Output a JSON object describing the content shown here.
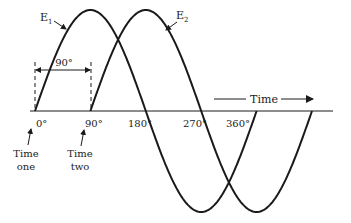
{
  "diagram": {
    "axis": {
      "y": 111,
      "x_start": 30,
      "x_end": 333,
      "origin_x": 35,
      "step_px": 55.4,
      "amplitude_px": 101
    },
    "waves": [
      {
        "name": "E1",
        "label_main": "E",
        "label_sub": "1",
        "start_deg": 0,
        "end_deg": 360,
        "stroke": "#1a1a1a"
      },
      {
        "name": "E2",
        "label_main": "E",
        "label_sub": "2",
        "start_deg": 90,
        "end_deg": 450,
        "stroke": "#1a1a1a"
      }
    ],
    "tick_labels": [
      {
        "text": "0°",
        "deg": 0
      },
      {
        "text": "90°",
        "deg": 90
      },
      {
        "text": "180°",
        "deg": 180
      },
      {
        "text": "270°",
        "deg": 270
      },
      {
        "text": "360°",
        "deg": 360
      }
    ],
    "phase_dimension": {
      "text": "90°",
      "from_deg": 0,
      "to_deg": 90
    },
    "time_arrow_label": "Time",
    "time_markers": [
      {
        "line1": "Time",
        "line2": "one",
        "deg": 0
      },
      {
        "line1": "Time",
        "line2": "two",
        "deg": 90
      }
    ]
  }
}
